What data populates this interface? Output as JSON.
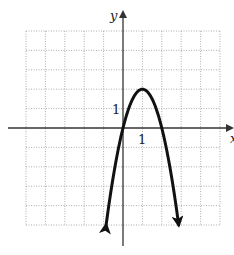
{
  "chart_data": {
    "type": "line",
    "title": "",
    "xlabel": "x",
    "ylabel": "y",
    "xlim": [
      -5,
      5
    ],
    "ylim": [
      -5,
      5
    ],
    "grid": true,
    "grid_style": "dotted",
    "tick_labels": {
      "x": [
        "1"
      ],
      "y": [
        "1"
      ]
    },
    "series": [
      {
        "name": "parabola",
        "equation": "y = -2(x - 1)^2 + 2",
        "vertex": [
          1,
          2
        ],
        "x_intercepts": [
          0,
          2
        ],
        "arrows_both_ends": true,
        "x": [
          -0.87,
          -0.5,
          0,
          0.25,
          0.5,
          0.75,
          1,
          1.25,
          1.5,
          1.75,
          2,
          2.5,
          2.87
        ],
        "values": [
          -5,
          -2.5,
          0,
          0.875,
          1.5,
          1.875,
          2,
          1.875,
          1.5,
          0.875,
          0,
          -2.5,
          -5
        ]
      }
    ]
  },
  "labels": {
    "x_axis": "x",
    "y_axis": "y",
    "x_tick": "1",
    "y_tick": "1"
  },
  "colors": {
    "curve": "#111111",
    "axis": "#333333",
    "grid": "#9a9a9a"
  }
}
